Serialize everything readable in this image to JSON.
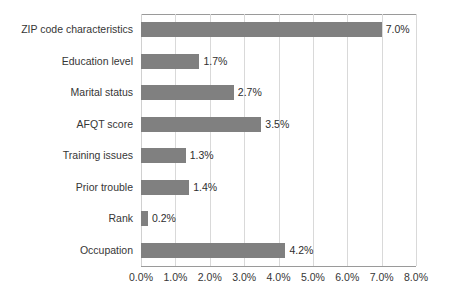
{
  "chart_data": {
    "type": "bar",
    "orientation": "horizontal",
    "title": "",
    "xlabel": "",
    "ylabel": "",
    "xlim": [
      0,
      8
    ],
    "xticks": [
      0,
      1,
      2,
      3,
      4,
      5,
      6,
      7,
      8
    ],
    "xtick_labels": [
      "0.0%",
      "1.0%",
      "2.0%",
      "3.0%",
      "4.0%",
      "5.0%",
      "6.0%",
      "7.0%",
      "8.0%"
    ],
    "grid": "vertical",
    "legend": "none",
    "bar_color": "#808080",
    "gridline_color": "#d9d9d9",
    "axis_color": "#9a9a9a",
    "background": "#ffffff",
    "categories": [
      "ZIP code characteristics",
      "Education level",
      "Marital status",
      "AFQT score",
      "Training issues",
      "Prior trouble",
      "Rank",
      "Occupation"
    ],
    "values": [
      7.0,
      1.7,
      2.7,
      3.5,
      1.3,
      1.4,
      0.2,
      4.2
    ],
    "value_labels": [
      "7.0%",
      "1.7%",
      "2.7%",
      "3.5%",
      "1.3%",
      "1.4%",
      "0.2%",
      "4.2%"
    ]
  }
}
